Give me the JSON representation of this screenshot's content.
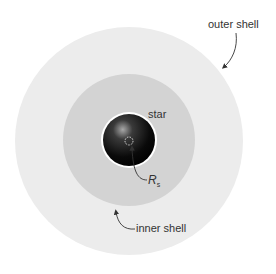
{
  "diagram": {
    "labels": {
      "outer_shell": "outer shell",
      "inner_shell": "inner shell",
      "star": "star",
      "radius_symbol": "R",
      "radius_subscript": "s"
    },
    "colors": {
      "outer_shell": "#ebebeb",
      "inner_shell": "#d4d4d4",
      "star_dark": "#0a0a0a",
      "star_highlight": "#9a9a9a",
      "text": "#333333"
    }
  }
}
